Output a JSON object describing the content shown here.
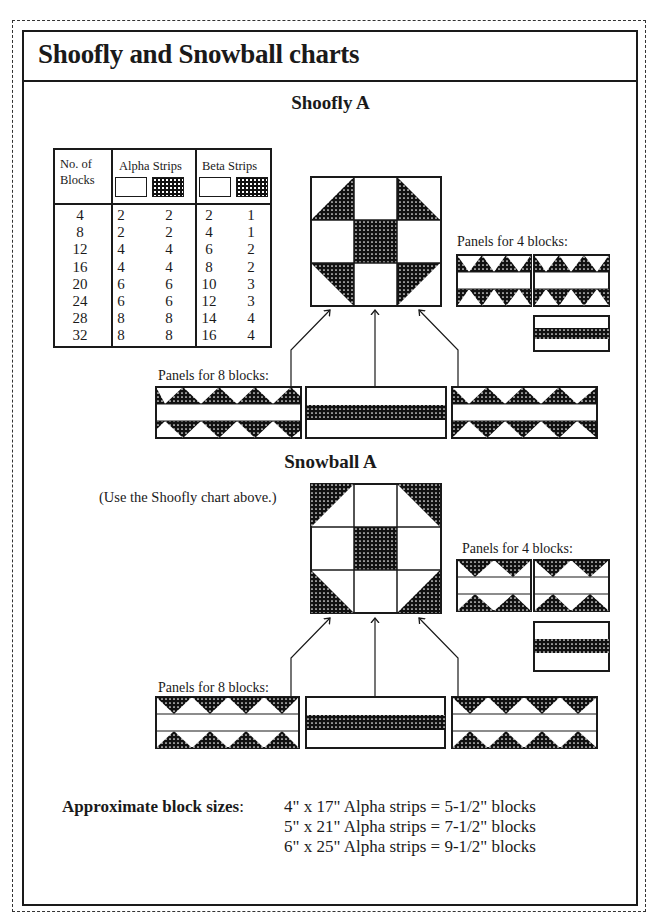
{
  "page": {
    "title": "Shoofly and Snowball charts"
  },
  "shoofly": {
    "heading": "Shoofly A",
    "table": {
      "headers": {
        "blocks": "No. of Blocks",
        "blocks_line1": "No. of",
        "blocks_line2": "Blocks",
        "alpha": "Alpha Strips",
        "beta": "Beta Strips"
      },
      "swatches": [
        "light",
        "dark",
        "light",
        "dark"
      ],
      "columns": [
        "No. of Blocks",
        "Alpha light",
        "Alpha dark",
        "Beta light",
        "Beta dark"
      ],
      "rows": [
        {
          "blocks": "4",
          "alpha_light": "2",
          "alpha_dark": "2",
          "beta_light": "2",
          "beta_dark": "1"
        },
        {
          "blocks": "8",
          "alpha_light": "2",
          "alpha_dark": "2",
          "beta_light": "4",
          "beta_dark": "1"
        },
        {
          "blocks": "12",
          "alpha_light": "4",
          "alpha_dark": "4",
          "beta_light": "6",
          "beta_dark": "2"
        },
        {
          "blocks": "16",
          "alpha_light": "4",
          "alpha_dark": "4",
          "beta_light": "8",
          "beta_dark": "2"
        },
        {
          "blocks": "20",
          "alpha_light": "6",
          "alpha_dark": "6",
          "beta_light": "10",
          "beta_dark": "3"
        },
        {
          "blocks": "24",
          "alpha_light": "6",
          "alpha_dark": "6",
          "beta_light": "12",
          "beta_dark": "3"
        },
        {
          "blocks": "28",
          "alpha_light": "8",
          "alpha_dark": "8",
          "beta_light": "14",
          "beta_dark": "4"
        },
        {
          "blocks": "32",
          "alpha_light": "8",
          "alpha_dark": "8",
          "beta_light": "16",
          "beta_dark": "4"
        }
      ],
      "col_blocks": "4\n8\n12\n16\n20\n24\n28\n32",
      "col_alpha_light": "2\n2\n4\n4\n6\n6\n8\n8",
      "col_alpha_dark": "2\n2\n4\n4\n6\n6\n8\n8",
      "col_beta_light": "2\n4\n6\n8\n10\n12\n14\n16",
      "col_beta_dark": "1\n1\n2\n2\n3\n3\n4\n4"
    },
    "panels_4_label": "Panels for 4 blocks:",
    "panels_8_label": "Panels for 8 blocks:"
  },
  "snowball": {
    "heading": "Snowball A",
    "note": "(Use the Shoofly chart above.)",
    "panels_4_label": "Panels for 4 blocks:",
    "panels_8_label": "Panels for 8 blocks:"
  },
  "block_sizes": {
    "label": "Approximate block sizes",
    "colon": ":",
    "lines": [
      "4\" x 17\" Alpha strips = 5-1/2\" blocks",
      "5\" x 21\" Alpha strips = 7-1/2\" blocks",
      "6\" x 25\" Alpha strips = 9-1/2\" blocks"
    ]
  },
  "colors": {
    "ink": "#1a1a1a",
    "paper": "#ffffff"
  }
}
